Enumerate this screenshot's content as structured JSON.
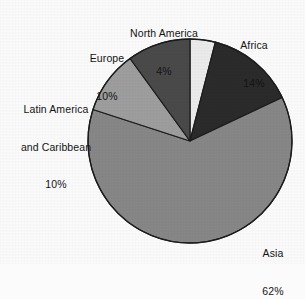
{
  "chart_data": {
    "type": "pie",
    "title": "",
    "subtitle": "",
    "xlabel": "",
    "ylabel": "",
    "legend_position": "none",
    "grid": false,
    "labels_inline": true,
    "units": "percent",
    "categories": [
      "North America",
      "Africa",
      "Asia",
      "Latin America and Caribbean",
      "Europe"
    ],
    "values": [
      4,
      14,
      62,
      10,
      10
    ],
    "slices": [
      {
        "name": "North America",
        "label_line1": "North America",
        "label_line2": "",
        "value": 4,
        "value_text": "4%",
        "color": "#ebebeb",
        "start_angle_deg": 0,
        "end_angle_deg": 14.4
      },
      {
        "name": "Africa",
        "label_line1": "Africa",
        "label_line2": "",
        "value": 14,
        "value_text": "14%",
        "color": "#2b2b2b",
        "start_angle_deg": 14.4,
        "end_angle_deg": 64.8
      },
      {
        "name": "Asia",
        "label_line1": "Asia",
        "label_line2": "",
        "value": 62,
        "value_text": "62%",
        "color": "#878787",
        "start_angle_deg": 64.8,
        "end_angle_deg": 288.0
      },
      {
        "name": "Latin America and Caribbean",
        "label_line1": "Latin America",
        "label_line2": "and Caribbean",
        "value": 10,
        "value_text": "10%",
        "color": "#9e9e9e",
        "start_angle_deg": 288.0,
        "end_angle_deg": 324.0
      },
      {
        "name": "Europe",
        "label_line1": "Europe",
        "label_line2": "",
        "value": 10,
        "value_text": "10%",
        "color": "#4a4a4a",
        "start_angle_deg": 324.0,
        "end_angle_deg": 360.0
      }
    ],
    "total": 100,
    "background_color": "#fbfbfb",
    "outline_color": "#1c1c1c",
    "text_color": "#141414"
  }
}
